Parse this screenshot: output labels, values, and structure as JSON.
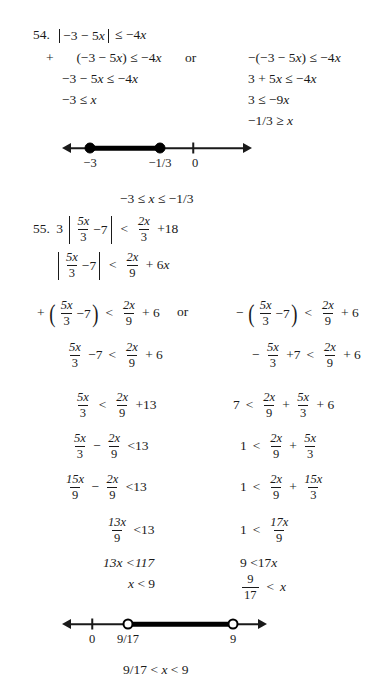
{
  "problems": [
    {
      "id": "prob-54",
      "number": "54.",
      "statement": {
        "abs_left": "−3 − 5",
        "abs_var": "x",
        "rel": "≤",
        "rhs": "−4",
        "rhs_var": "x"
      },
      "branches": {
        "connector": "or",
        "left": [
          "+   (−3 − 5x) ≤ −4x",
          "−3 − 5x ≤ −4x",
          "−3 ≤ x"
        ],
        "right": [
          "−(−3 − 5x) ≤ −4x",
          "3 + 5x ≤ −4x",
          "3 ≤ −9x",
          "−1/3 ≥ x"
        ]
      },
      "numberline": {
        "labels": [
          "−3",
          "−1/3",
          "0"
        ],
        "tick_label": "0",
        "endpoint_type": "closed",
        "segment": "between −3 and −1/3"
      },
      "solution": "−3 ≤ x ≤ −1/3"
    },
    {
      "id": "prob-55",
      "number": "55.",
      "numberline": {
        "labels": [
          "0",
          "9/17",
          "9"
        ],
        "tick_label": "0",
        "endpoint_type": "open",
        "segment": "between 9/17 and 9"
      },
      "solution": "9/17 < x < 9",
      "connector": "or"
    }
  ],
  "text": {
    "p54_num": "54.",
    "p54_abs_open": "|",
    "p54_abs_body_a": "−3 − 5",
    "p54_x1": "x",
    "p54_abs_close": "|",
    "p54_rel": "≤ −4",
    "p54_x2": "x",
    "p54_l1_plus": "+",
    "p54_l1": "(−3 − 5",
    "p54_l1_x": "x",
    "p54_l1_end": ") ≤ −4",
    "p54_l1_x2": "x",
    "p54_l2_a": "−3 − 5",
    "p54_l2_x": "x",
    "p54_l2_b": " ≤ −4",
    "p54_l2_x2": "x",
    "p54_l3_a": "−3 ≤ ",
    "p54_l3_x": "x",
    "p54_or": "or",
    "p54_r1_a": "−(−3 − 5",
    "p54_r1_x": "x",
    "p54_r1_b": ") ≤ −4",
    "p54_r1_x2": "x",
    "p54_r2_a": "3 + 5",
    "p54_r2_x": "x",
    "p54_r2_b": " ≤ −4",
    "p54_r2_x2": "x",
    "p54_r3_a": "3 ≤ −9",
    "p54_r3_x": "x",
    "p54_r4_a": "−1/3 ≥ ",
    "p54_r4_x": "x",
    "nl1_lbl_a": "−3",
    "nl1_lbl_b": "−1/3",
    "nl1_lbl_c": "0",
    "p54_sol_a": "−3 ≤ ",
    "p54_sol_x": "x",
    "p54_sol_b": " ≤ −1/3",
    "p55_num": "55.",
    "p55_lead3": "3",
    "n5x": "5x",
    "d3": "3",
    "minus7": "−7",
    "lt": "<",
    "n2x": "2x",
    "plus18": "+18",
    "d9": "9",
    "plus6x": "+ 6",
    "x_it": "x",
    "plus6": "+ 6",
    "plus13": "+13",
    "lt13": "<13",
    "n13x": "13x",
    "lt117": "13x <117",
    "x_lt_9": " < 9",
    "p55_or": "or",
    "minus": "−",
    "plus": "+",
    "plus7": "+7",
    "seven": "7",
    "one": "1",
    "n15x": "15x",
    "n17x": "17x",
    "d17": "17",
    "nine": "9",
    "nine_lt": "9 <17",
    "lt_x": " < ",
    "nl2_lbl_a": "0",
    "nl2_lbl_b": "9/17",
    "nl2_lbl_c": "9",
    "p55_sol_a": "9/17 < ",
    "p55_sol_x": "x",
    "p55_sol_b": " < 9"
  },
  "colors": {
    "ink": "#1a1a1a",
    "paper": "#ffffff",
    "line": "#000000"
  }
}
